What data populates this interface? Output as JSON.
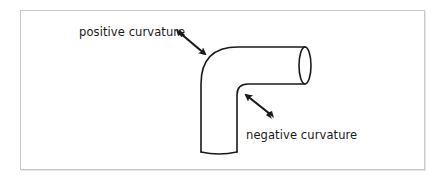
{
  "figure": {
    "type": "diagram",
    "labels": {
      "positive": "positive curvature",
      "negative": "negative curvature"
    },
    "icons": {
      "positive_arrow": "arrow-pointing-to-outer-bend",
      "negative_arrow": "arrow-pointing-to-inner-bend"
    },
    "colors": {
      "stroke": "#1a1a1a",
      "frame_border": "#c9c9c9",
      "background": "#ffffff"
    }
  }
}
